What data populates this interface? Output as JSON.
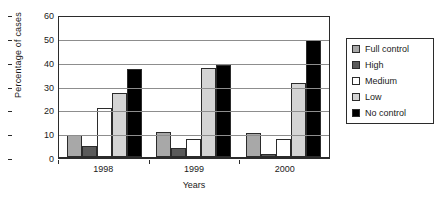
{
  "chart_data": {
    "type": "bar",
    "title": "",
    "xlabel": "Years",
    "ylabel": "Percentage of cases",
    "categories": [
      "1998",
      "1999",
      "2000"
    ],
    "ylim": [
      0,
      60
    ],
    "yticks": [
      0,
      10,
      20,
      30,
      40,
      50,
      60
    ],
    "grid": true,
    "legend_position": "right",
    "series": [
      {
        "name": "Full control",
        "color": "#a8a8a8",
        "values": [
          9.5,
          10.8,
          10.3
        ]
      },
      {
        "name": "High",
        "color": "#5a5a5a",
        "values": [
          4.7,
          3.7,
          1.4
        ]
      },
      {
        "name": "Medium",
        "color": "#ffffff",
        "values": [
          20.8,
          7.5,
          7.8
        ]
      },
      {
        "name": "Low",
        "color": "#d4d4d4",
        "values": [
          27.1,
          38.0,
          31.3
        ]
      },
      {
        "name": "No control",
        "color": "#000000",
        "values": [
          37.3,
          39.2,
          50.0
        ]
      }
    ]
  }
}
